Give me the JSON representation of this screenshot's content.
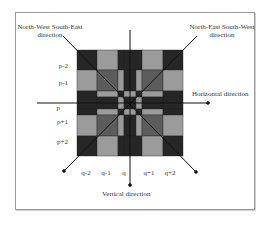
{
  "labels": {
    "nw_se": [
      "North-West South-East",
      "direction"
    ],
    "ne_sw": [
      "North-East South-West",
      "direction"
    ],
    "horizontal": "Horizontal direction",
    "vertical": "Vertical direction"
  },
  "row_labels": [
    "p-2",
    "p-1",
    "p",
    "p+1",
    "p+2"
  ],
  "col_labels": [
    "q-2",
    "q-1",
    "q",
    "q+1",
    "q+2"
  ],
  "colors": {
    "dark": "#262626",
    "mid": "#5c5c5c",
    "light": "#9b9b9b",
    "line": "#111111"
  }
}
